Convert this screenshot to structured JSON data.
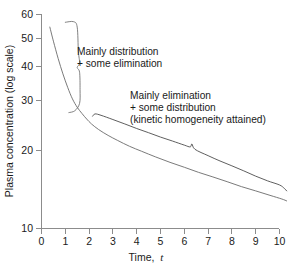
{
  "chart_data": {
    "type": "line",
    "title": "",
    "xlabel": "Time, t",
    "ylabel": "Plasma concentration (log scale)",
    "yscale": "log",
    "xlim": [
      0,
      10.4
    ],
    "ylim": [
      10,
      60
    ],
    "grid": false,
    "legend": null,
    "xticks": [
      "0",
      "1",
      "2",
      "3",
      "4",
      "5",
      "6",
      "7",
      "8",
      "9",
      "10"
    ],
    "xtick_values": [
      0,
      1,
      2,
      3,
      4,
      5,
      6,
      7,
      8,
      9,
      10
    ],
    "yticks": [
      "60",
      "50",
      "40",
      "30",
      "20",
      "10"
    ],
    "ytick_values": [
      60,
      50,
      40,
      30,
      20,
      10
    ],
    "series": [
      {
        "name": "upper-curve",
        "points": [
          [
            2.15,
            25.6
          ],
          [
            2.25,
            26.1
          ],
          [
            2.5,
            25.8
          ],
          [
            3.0,
            24.9
          ],
          [
            3.5,
            24.0
          ],
          [
            4.0,
            23.1
          ],
          [
            4.5,
            22.3
          ],
          [
            5.0,
            21.5
          ],
          [
            5.5,
            20.8
          ],
          [
            6.0,
            20.1
          ],
          [
            6.25,
            19.8
          ],
          [
            6.32,
            20.3
          ],
          [
            6.45,
            19.4
          ],
          [
            7.0,
            18.4
          ],
          [
            7.5,
            17.6
          ],
          [
            8.0,
            16.9
          ],
          [
            8.5,
            16.2
          ],
          [
            9.0,
            15.5
          ],
          [
            9.5,
            14.9
          ],
          [
            10.0,
            14.4
          ],
          [
            10.2,
            14.0
          ],
          [
            10.3,
            13.7
          ]
        ]
      },
      {
        "name": "lower-curve",
        "points": [
          [
            0.35,
            54.0
          ],
          [
            0.5,
            48.0
          ],
          [
            0.7,
            41.5
          ],
          [
            0.9,
            36.5
          ],
          [
            1.1,
            32.6
          ],
          [
            1.3,
            29.6
          ],
          [
            1.5,
            27.6
          ],
          [
            1.7,
            26.2
          ],
          [
            1.9,
            25.0
          ],
          [
            2.1,
            24.0
          ],
          [
            2.4,
            22.9
          ],
          [
            2.8,
            21.8
          ],
          [
            3.2,
            20.9
          ],
          [
            3.7,
            19.9
          ],
          [
            4.2,
            19.1
          ],
          [
            4.8,
            18.2
          ],
          [
            5.4,
            17.4
          ],
          [
            6.0,
            16.7
          ],
          [
            6.6,
            16.0
          ],
          [
            7.2,
            15.4
          ],
          [
            7.8,
            14.8
          ],
          [
            8.4,
            14.2
          ],
          [
            9.0,
            13.7
          ],
          [
            9.6,
            13.2
          ],
          [
            10.1,
            12.8
          ],
          [
            10.3,
            12.6
          ]
        ]
      },
      {
        "name": "distribution-brace",
        "points": [
          [
            1.0,
            56.2
          ],
          [
            1.35,
            56.5
          ],
          [
            1.5,
            54.0
          ],
          [
            1.55,
            44.0
          ],
          [
            1.6,
            40.0
          ],
          [
            1.5,
            38.5
          ],
          [
            1.6,
            37.0
          ],
          [
            1.62,
            32.0
          ],
          [
            1.6,
            28.5
          ],
          [
            1.4,
            26.8
          ],
          [
            1.15,
            26.4
          ]
        ]
      }
    ],
    "annotations": [
      {
        "name": "distribution-annotation",
        "lines": [
          "Mainly distribution",
          "+ some elimination"
        ],
        "x_px": 77,
        "y_px": 53
      },
      {
        "name": "elimination-annotation",
        "lines": [
          "Mainly elimination",
          "+ some distribution",
          "(kinetic homogeneity attained)"
        ],
        "x_px": 130,
        "y_px": 97
      }
    ],
    "colors": {
      "curve": "#6b6b6b",
      "curve_dark": "#4d4d4d",
      "axis": "#8c8c8c",
      "text": "#1a1a1a",
      "background": "#ffffff"
    }
  }
}
